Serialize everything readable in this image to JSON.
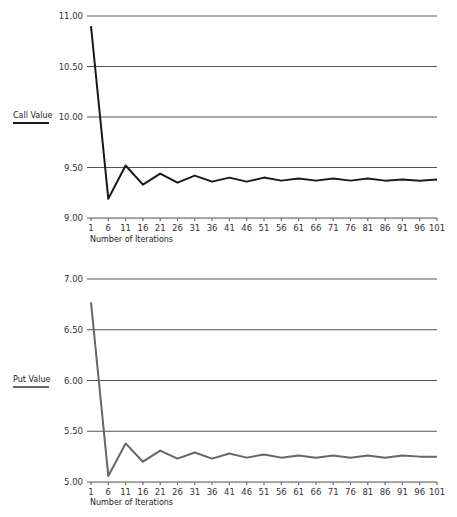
{
  "chart_data": [
    {
      "type": "line",
      "title": "",
      "ylabel": "Call Value",
      "xlabel": "Number of Iterations",
      "ylim": [
        9.0,
        11.0
      ],
      "yticks": [
        "9.00",
        "9.50",
        "10.00",
        "10.50",
        "11.00"
      ],
      "grid": true,
      "line_color": "#1a1a1a",
      "x": [
        1,
        6,
        11,
        16,
        21,
        26,
        31,
        36,
        41,
        46,
        51,
        56,
        61,
        66,
        71,
        76,
        81,
        86,
        91,
        96,
        101
      ],
      "series": [
        {
          "name": "Call Value",
          "values": [
            10.9,
            9.19,
            9.52,
            9.33,
            9.44,
            9.35,
            9.42,
            9.36,
            9.4,
            9.36,
            9.4,
            9.37,
            9.39,
            9.37,
            9.39,
            9.37,
            9.39,
            9.37,
            9.38,
            9.37,
            9.38
          ]
        }
      ]
    },
    {
      "type": "line",
      "title": "",
      "ylabel": "Put Value",
      "xlabel": "Number of Iterations",
      "ylim": [
        5.0,
        7.0
      ],
      "yticks": [
        "5.00",
        "5.50",
        "6.00",
        "6.50",
        "7.00"
      ],
      "grid": true,
      "line_color": "#666666",
      "x": [
        1,
        6,
        11,
        16,
        21,
        26,
        31,
        36,
        41,
        46,
        51,
        56,
        61,
        66,
        71,
        76,
        81,
        86,
        91,
        96,
        101
      ],
      "series": [
        {
          "name": "Put Value",
          "values": [
            6.77,
            5.06,
            5.38,
            5.2,
            5.31,
            5.23,
            5.29,
            5.23,
            5.28,
            5.24,
            5.27,
            5.24,
            5.26,
            5.24,
            5.26,
            5.24,
            5.26,
            5.24,
            5.26,
            5.25,
            5.25
          ]
        }
      ]
    }
  ],
  "labels": {
    "call_ylabel": "Call Value",
    "put_ylabel": "Put Value",
    "xlabel": "Number of Iterations"
  }
}
